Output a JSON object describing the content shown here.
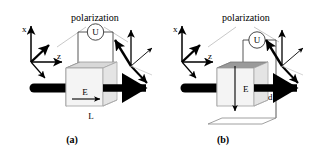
{
  "figure": {
    "caption_a": "(a)",
    "caption_b": "(b)",
    "background_color": "#ffffff",
    "ink_color": "#000000",
    "crystal_face_light": "#f2f2f2",
    "crystal_face_dark": "#8c8c8c",
    "crystal_face_top": "#a8a8a8",
    "leader_color": "#c8c8c8"
  },
  "panel_a": {
    "caption": "(a)",
    "title_polarization": "polarization",
    "axes": {
      "x": "x",
      "y": "y",
      "z": "z"
    },
    "meter_label": "U",
    "field_label": "E",
    "length_label": "L"
  },
  "panel_b": {
    "caption": "(b)",
    "title_polarization": "polarization",
    "axes": {
      "x": "x",
      "y": "y",
      "z": "z"
    },
    "meter_label": "U",
    "field_label": "E",
    "thickness_label": "d"
  }
}
